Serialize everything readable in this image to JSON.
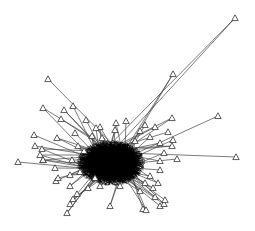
{
  "graph": {
    "type": "network",
    "width": 255,
    "height": 231,
    "background": "#ffffff",
    "edge_color": "#444444",
    "core_color": "#000000",
    "node_shape": "triangle",
    "node_fill": "#ffffff",
    "node_stroke": "#333333",
    "center": [
      113,
      162
    ],
    "core": {
      "cx": 111,
      "cy": 163,
      "rx": 30,
      "ry": 20
    },
    "outer_nodes": [
      [
        235,
        18
      ],
      [
        173,
        74
      ],
      [
        48,
        79
      ],
      [
        218,
        116
      ],
      [
        43,
        108
      ],
      [
        64,
        110
      ],
      [
        73,
        106
      ],
      [
        86,
        120
      ],
      [
        61,
        119
      ],
      [
        100,
        127
      ],
      [
        116,
        123
      ],
      [
        126,
        121
      ],
      [
        145,
        125
      ],
      [
        155,
        127
      ],
      [
        172,
        118
      ],
      [
        168,
        132
      ],
      [
        173,
        140
      ],
      [
        172,
        146
      ],
      [
        177,
        159
      ],
      [
        236,
        157
      ],
      [
        34,
        135
      ],
      [
        57,
        138
      ],
      [
        35,
        146
      ],
      [
        42,
        149
      ],
      [
        40,
        155
      ],
      [
        43,
        160
      ],
      [
        18,
        162
      ],
      [
        43,
        160
      ],
      [
        55,
        168
      ],
      [
        56,
        181
      ],
      [
        58,
        178
      ],
      [
        70,
        186
      ],
      [
        77,
        194
      ],
      [
        73,
        199
      ],
      [
        70,
        204
      ],
      [
        67,
        213
      ],
      [
        110,
        206
      ],
      [
        143,
        209
      ],
      [
        146,
        210
      ],
      [
        160,
        206
      ],
      [
        164,
        204
      ],
      [
        155,
        197
      ],
      [
        140,
        191
      ],
      [
        100,
        186
      ],
      [
        88,
        188
      ],
      [
        165,
        200
      ],
      [
        153,
        188
      ],
      [
        160,
        170
      ],
      [
        96,
        128
      ],
      [
        75,
        133
      ],
      [
        92,
        136
      ]
    ],
    "inner_nodes": [
      [
        78,
        146
      ],
      [
        84,
        151
      ],
      [
        140,
        131
      ],
      [
        150,
        137
      ],
      [
        160,
        143
      ],
      [
        164,
        153
      ],
      [
        72,
        160
      ],
      [
        80,
        172
      ],
      [
        150,
        176
      ],
      [
        158,
        183
      ],
      [
        120,
        186
      ],
      [
        95,
        178
      ],
      [
        135,
        141
      ],
      [
        115,
        130
      ],
      [
        102,
        138
      ],
      [
        160,
        161
      ],
      [
        70,
        175
      ],
      [
        145,
        183
      ]
    ]
  }
}
